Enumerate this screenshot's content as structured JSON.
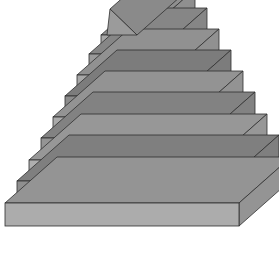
{
  "figure": {
    "kind": "3d-stepped-pyramid-diagram",
    "background_color": "#ffffff",
    "outline_color": "#2e2e2e",
    "canvas": {
      "width": 279,
      "height": 256
    },
    "projection": {
      "depth_dx": 52,
      "depth_dy": -46,
      "step_inset_x": 11.5,
      "tier_height": 21.2
    },
    "apex": {
      "name": "apex-cap",
      "tip": {
        "x": 110,
        "y": 9
      },
      "front_color": "#9b9b9b",
      "top_color": "#8a8a8a"
    },
    "tiers": [
      {
        "index": 8,
        "label": "tier-8",
        "front_color": "#a6a6a6",
        "top_color": "#8f8f8f",
        "left_x": 101,
        "right_x": 143,
        "top_y": 35,
        "bottom_y": 54
      },
      {
        "index": 7,
        "label": "tier-7",
        "front_color": "#9a9a9a",
        "top_color": "#868686",
        "left_x": 89,
        "right_x": 155,
        "top_y": 54,
        "bottom_y": 75
      },
      {
        "index": 6,
        "label": "tier-6",
        "front_color": "#a8a8a8",
        "top_color": "#919191",
        "left_x": 77,
        "right_x": 167,
        "top_y": 75,
        "bottom_y": 96
      },
      {
        "index": 5,
        "label": "tier-5",
        "front_color": "#8c8c8c",
        "top_color": "#7c7c7c",
        "left_x": 65,
        "right_x": 179,
        "top_y": 96,
        "bottom_y": 117
      },
      {
        "index": 4,
        "label": "tier-4",
        "front_color": "#aaaaaa",
        "top_color": "#939393",
        "left_x": 53,
        "right_x": 191,
        "top_y": 117,
        "bottom_y": 138
      },
      {
        "index": 3,
        "label": "tier-3",
        "front_color": "#949494",
        "top_color": "#828282",
        "left_x": 41,
        "right_x": 203,
        "top_y": 138,
        "bottom_y": 160
      },
      {
        "index": 2,
        "label": "tier-2",
        "front_color": "#aeaeae",
        "top_color": "#979797",
        "left_x": 29,
        "right_x": 215,
        "top_y": 160,
        "bottom_y": 181
      },
      {
        "index": 1,
        "label": "tier-1",
        "front_color": "#8f8f8f",
        "top_color": "#7f7f7f",
        "left_x": 17,
        "right_x": 227,
        "top_y": 181,
        "bottom_y": 203
      },
      {
        "index": 0,
        "label": "tier-0-base",
        "front_color": "#acacac",
        "top_color": "#949494",
        "left_x": 5,
        "right_x": 239,
        "top_y": 203,
        "bottom_y": 226
      }
    ]
  }
}
